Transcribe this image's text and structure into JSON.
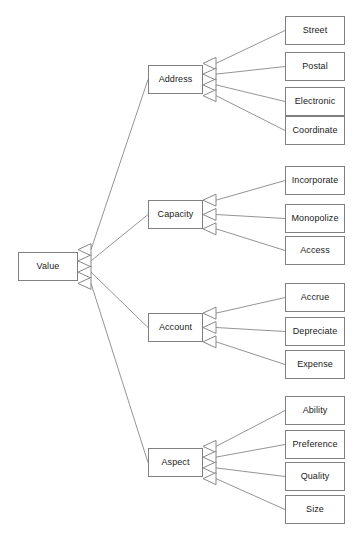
{
  "diagram": {
    "type": "generalization-tree",
    "style": {
      "box_fill": "#ffffff",
      "box_border": "#808080",
      "edge_color": "#888888",
      "text_color": "#1a1a1a",
      "arrowhead": "hollow-triangle"
    },
    "root": {
      "id": "value",
      "label": "Value",
      "x": 18,
      "y": 252,
      "w": 60,
      "h": 29
    },
    "branches": [
      {
        "id": "address",
        "label": "Address",
        "x": 148,
        "y": 65,
        "w": 55,
        "h": 29,
        "children": [
          {
            "id": "street",
            "label": "Street",
            "x": 285,
            "y": 16,
            "w": 60,
            "h": 29
          },
          {
            "id": "postal",
            "label": "Postal",
            "x": 285,
            "y": 52,
            "w": 60,
            "h": 29
          },
          {
            "id": "electronic",
            "label": "Electronic",
            "x": 285,
            "y": 87,
            "w": 60,
            "h": 29
          },
          {
            "id": "coordinate",
            "label": "Coordinate",
            "x": 285,
            "y": 116,
            "w": 60,
            "h": 29
          }
        ]
      },
      {
        "id": "capacity",
        "label": "Capacity",
        "x": 148,
        "y": 200,
        "w": 55,
        "h": 29,
        "children": [
          {
            "id": "incorporate",
            "label": "Incorporate",
            "x": 285,
            "y": 166,
            "w": 60,
            "h": 29
          },
          {
            "id": "monopolize",
            "label": "Monopolize",
            "x": 285,
            "y": 204,
            "w": 60,
            "h": 29
          },
          {
            "id": "access",
            "label": "Access",
            "x": 285,
            "y": 236,
            "w": 60,
            "h": 29
          }
        ]
      },
      {
        "id": "account",
        "label": "Account",
        "x": 148,
        "y": 313,
        "w": 55,
        "h": 29,
        "children": [
          {
            "id": "accrue",
            "label": "Accrue",
            "x": 285,
            "y": 283,
            "w": 60,
            "h": 29
          },
          {
            "id": "depreciate",
            "label": "Depreciate",
            "x": 285,
            "y": 317,
            "w": 60,
            "h": 29
          },
          {
            "id": "expense",
            "label": "Expense",
            "x": 285,
            "y": 350,
            "w": 60,
            "h": 29
          }
        ]
      },
      {
        "id": "aspect",
        "label": "Aspect",
        "x": 148,
        "y": 448,
        "w": 55,
        "h": 29,
        "children": [
          {
            "id": "ability",
            "label": "Ability",
            "x": 285,
            "y": 396,
            "w": 60,
            "h": 29
          },
          {
            "id": "preference",
            "label": "Preference",
            "x": 285,
            "y": 430,
            "w": 60,
            "h": 29
          },
          {
            "id": "quality",
            "label": "Quality",
            "x": 285,
            "y": 462,
            "w": 60,
            "h": 29
          },
          {
            "id": "size",
            "label": "Size",
            "x": 285,
            "y": 495,
            "w": 60,
            "h": 29
          }
        ]
      }
    ]
  }
}
